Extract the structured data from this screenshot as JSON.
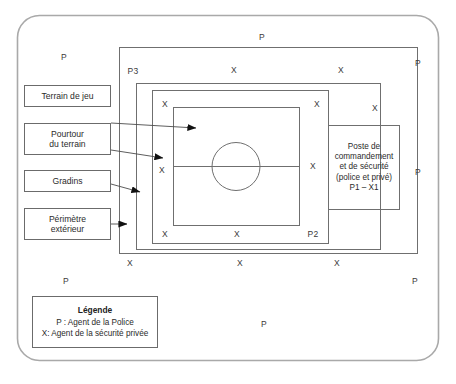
{
  "diagram": {
    "outer_frame": {
      "name": "perimetre-exterieur"
    },
    "zones": [
      {
        "id": "perimetre-exterieur",
        "code": "P3"
      },
      {
        "id": "gradins",
        "code": ""
      },
      {
        "id": "pourtour-du-terrain",
        "code": "P2"
      },
      {
        "id": "terrain-de-jeu",
        "code": ""
      }
    ],
    "labels": [
      {
        "id": "terrain-de-jeu",
        "text": "Terrain de jeu"
      },
      {
        "id": "pourtour-du-terrain",
        "line1": "Pourtour",
        "line2": "du terrain"
      },
      {
        "id": "gradins",
        "text": "Gradins"
      },
      {
        "id": "perimetre-exterieur",
        "line1": "Périmètre",
        "line2": "extérieur"
      }
    ],
    "command_post": {
      "line1": "Poste de",
      "line2": "commandement",
      "line3": "et de sécurité",
      "line4": "(police et privé)",
      "line5": "P1 – X1"
    },
    "zone_codes": {
      "p3": "P3",
      "p2": "P2"
    },
    "markers": [
      {
        "label": "P",
        "x": 262,
        "y": 37
      },
      {
        "label": "P",
        "x": 64,
        "y": 57
      },
      {
        "label": "P",
        "x": 418,
        "y": 63
      },
      {
        "label": "P",
        "x": 418,
        "y": 172
      },
      {
        "label": "P",
        "x": 415,
        "y": 281
      },
      {
        "label": "P",
        "x": 66,
        "y": 281
      },
      {
        "label": "P",
        "x": 264,
        "y": 324
      },
      {
        "label": "X",
        "x": 234,
        "y": 70
      },
      {
        "label": "X",
        "x": 341,
        "y": 70
      },
      {
        "label": "X",
        "x": 165,
        "y": 104
      },
      {
        "label": "X",
        "x": 317,
        "y": 104
      },
      {
        "label": "X",
        "x": 375,
        "y": 108
      },
      {
        "label": "X",
        "x": 162,
        "y": 170
      },
      {
        "label": "X",
        "x": 313,
        "y": 166
      },
      {
        "label": "X",
        "x": 165,
        "y": 234
      },
      {
        "label": "X",
        "x": 237,
        "y": 234
      },
      {
        "label": "X",
        "x": 130,
        "y": 263
      },
      {
        "label": "X",
        "x": 240,
        "y": 263
      },
      {
        "label": "X",
        "x": 337,
        "y": 263
      }
    ],
    "legend": {
      "title": "Légende",
      "line1": "P : Agent de la Police",
      "line2": "X: Agent de la sécurité privée"
    }
  }
}
